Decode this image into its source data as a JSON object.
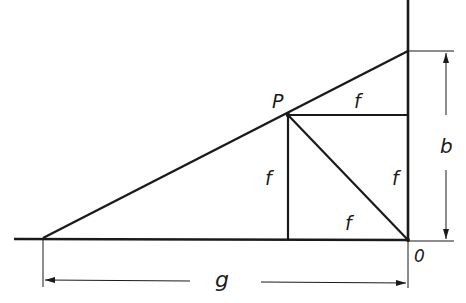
{
  "diagram": {
    "type": "geometric-construction",
    "labels": {
      "point_p": "P",
      "origin": "0",
      "f_top": "f",
      "f_left": "f",
      "f_right": "f",
      "f_bottom": "f",
      "dim_b": "b",
      "dim_g": "g"
    },
    "colors": {
      "stroke": "#1a1a1a",
      "background": "#ffffff"
    }
  }
}
